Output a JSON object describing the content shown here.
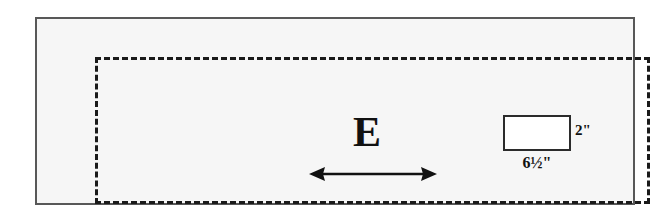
{
  "diagram": {
    "frame": {
      "name": "outer-frame",
      "border_color": "#585858",
      "fill_color": "#f6f6f6"
    },
    "dashed_region": {
      "name": "dashed-region",
      "border_color": "#1a1a1a",
      "border_style": "dashed"
    },
    "letter_marker": {
      "text": "E"
    },
    "span_arrow": {
      "icon": "double-headed-arrow-icon",
      "color": "#111111"
    },
    "block": {
      "fill_color": "#ffffff",
      "border_color": "#2b2b2b",
      "height_label": "2\"",
      "width_label": "6½\""
    }
  }
}
